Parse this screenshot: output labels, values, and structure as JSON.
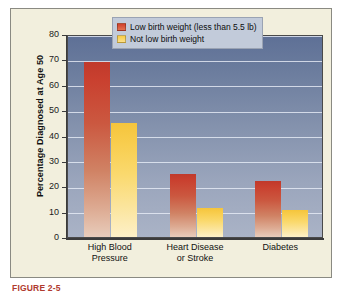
{
  "chart_data": {
    "type": "bar",
    "title": "",
    "xlabel": "",
    "ylabel": "Percentage Diagnosed at Age 50",
    "ylim": [
      0,
      80
    ],
    "ytick_step": 10,
    "yticks": [
      "80",
      "70",
      "60",
      "50",
      "40",
      "30",
      "20",
      "10",
      "0"
    ],
    "grid": true,
    "grid_axis": "y",
    "legend_position": "top-right-inside",
    "categories": [
      "High Blood Pressure",
      "Heart Disease or Stroke",
      "Diabetes"
    ],
    "category_lines": [
      [
        "High Blood",
        "Pressure"
      ],
      [
        "Heart Disease",
        "or Stroke"
      ],
      [
        "Diabetes"
      ]
    ],
    "series": [
      {
        "name": "Low birth weight (less than 5.5 lb)",
        "color": "#c0392b",
        "values": [
          69,
          25,
          22
        ]
      },
      {
        "name": "Not low birth weight",
        "color": "#f5c53c",
        "values": [
          45,
          11.5,
          10.5
        ]
      }
    ]
  },
  "legend": {
    "items": [
      {
        "label": "Low birth weight (less than 5.5 lb)",
        "swatch": "lbw"
      },
      {
        "label": "Not low birth weight",
        "swatch": "nlbw"
      }
    ]
  },
  "caption": {
    "text": "FIGURE 2-5"
  },
  "colors": {
    "panel_background": "#f2efdd",
    "plot_top": "#5e7096",
    "plot_bottom": "#aab3c6",
    "gridline": "#e9eef7",
    "axis": "#3b3b3b",
    "legend_background": "#c2cbda",
    "series_low_birth_weight": "#c0392b",
    "series_not_low_birth_weight": "#f5c53c"
  }
}
